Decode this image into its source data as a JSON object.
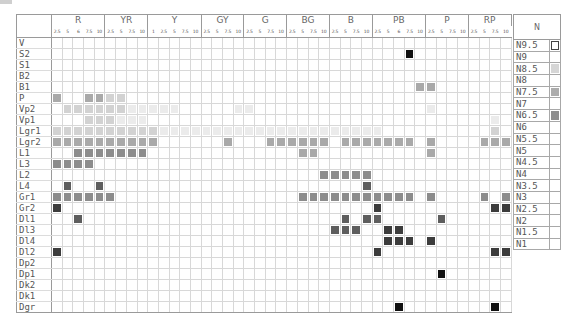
{
  "chart_data": {
    "type": "heatmap",
    "column_groups": [
      {
        "hue": "R",
        "steps": [
          "2.5",
          "5",
          "6",
          "7.5",
          "10"
        ]
      },
      {
        "hue": "YR",
        "steps": [
          "2.5",
          "5",
          "7.5",
          "10"
        ]
      },
      {
        "hue": "Y",
        "steps": [
          "1",
          "2.5",
          "5",
          "7.5",
          "10"
        ]
      },
      {
        "hue": "GY",
        "steps": [
          "2.5",
          "5",
          "7.5",
          "10"
        ]
      },
      {
        "hue": "G",
        "steps": [
          "2.5",
          "5",
          "7.5",
          "10"
        ]
      },
      {
        "hue": "BG",
        "steps": [
          "2.5",
          "5",
          "7.5",
          "10"
        ]
      },
      {
        "hue": "B",
        "steps": [
          "2.5",
          "5",
          "7.5",
          "10"
        ]
      },
      {
        "hue": "PB",
        "steps": [
          "2.5",
          "5",
          "6",
          "7.5",
          "10"
        ]
      },
      {
        "hue": "P",
        "steps": [
          "2.5",
          "5",
          "7.5",
          "10"
        ]
      },
      {
        "hue": "RP",
        "steps": [
          "2.5",
          "5",
          "7.5",
          "10"
        ]
      }
    ],
    "row_groups": [
      [
        "V"
      ],
      [
        "S2",
        "S1"
      ],
      [
        "B2",
        "B1"
      ],
      [
        "P"
      ],
      [
        "Vp2",
        "Vp1"
      ],
      [
        "Lgr1",
        "Lgr2"
      ],
      [
        "L1",
        "L3",
        "L2",
        "L4"
      ],
      [
        "Gr1",
        "Gr2"
      ],
      [
        "Dl1",
        "Dl3",
        "Dl4",
        "Dl2"
      ],
      [
        "Dp2",
        "Dp1"
      ],
      [
        "Dk2",
        "Dk1"
      ],
      [
        "Dgr"
      ]
    ],
    "shade_scale": {
      "L": "#ebebeb",
      "ML": "#d2d2d2",
      "M": "#a9a9a9",
      "MD": "#8c8c8c",
      "D": "#5e5e5e",
      "DK": "#3c3c3c",
      "K": "#111111"
    },
    "rows": [
      {
        "label": "V",
        "cells": {}
      },
      {
        "label": "S2",
        "cells": {
          "33": "K"
        }
      },
      {
        "label": "S1",
        "cells": {}
      },
      {
        "label": "B2",
        "cells": {}
      },
      {
        "label": "B1",
        "cells": {
          "34": "M",
          "35": "M"
        }
      },
      {
        "label": "P",
        "cells": {
          "0": "M",
          "3": "M",
          "4": "M",
          "5": "ML",
          "6": "ML"
        }
      },
      {
        "label": "Vp2",
        "cells": {
          "1": "ML",
          "2": "ML",
          "3": "ML",
          "4": "ML",
          "5": "ML",
          "6": "ML",
          "7": "L",
          "8": "L",
          "9": "L",
          "10": "L",
          "11": "L",
          "17": "L",
          "18": "L",
          "35": "L"
        }
      },
      {
        "label": "Vp1",
        "cells": {
          "3": "ML",
          "4": "ML",
          "5": "ML",
          "6": "L",
          "7": "L",
          "8": "L",
          "41": "L"
        }
      },
      {
        "label": "Lgr1",
        "cells": {
          "0": "ML",
          "1": "ML",
          "2": "ML",
          "3": "ML",
          "4": "ML",
          "5": "ML",
          "6": "ML",
          "7": "ML",
          "8": "ML",
          "9": "ML",
          "10": "L",
          "11": "L",
          "12": "L",
          "13": "L",
          "14": "L",
          "15": "L",
          "16": "L",
          "17": "L",
          "18": "L",
          "19": "L",
          "20": "L",
          "21": "L",
          "22": "L",
          "23": "L",
          "24": "L",
          "25": "L",
          "26": "L",
          "27": "L",
          "28": "L",
          "29": "L",
          "30": "L",
          "41": "ML"
        }
      },
      {
        "label": "Lgr2",
        "cells": {
          "0": "M",
          "1": "M",
          "2": "M",
          "3": "M",
          "4": "M",
          "5": "M",
          "6": "M",
          "7": "M",
          "8": "M",
          "9": "M",
          "16": "M",
          "20": "M",
          "21": "M",
          "22": "M",
          "23": "M",
          "24": "M",
          "25": "M",
          "27": "M",
          "28": "M",
          "29": "M",
          "30": "M",
          "31": "M",
          "32": "M",
          "33": "M",
          "35": "M",
          "40": "M",
          "41": "M",
          "42": "M"
        }
      },
      {
        "label": "L1",
        "cells": {
          "2": "MD",
          "3": "MD",
          "4": "MD",
          "5": "MD",
          "6": "MD",
          "7": "MD",
          "8": "MD",
          "23": "M",
          "24": "M",
          "35": "M"
        }
      },
      {
        "label": "L3",
        "cells": {
          "0": "MD",
          "1": "MD",
          "2": "MD",
          "3": "MD"
        }
      },
      {
        "label": "L2",
        "cells": {
          "25": "MD",
          "26": "MD",
          "27": "MD",
          "28": "MD",
          "29": "MD"
        }
      },
      {
        "label": "L4",
        "cells": {
          "1": "D",
          "4": "D",
          "29": "D"
        }
      },
      {
        "label": "Gr1",
        "cells": {
          "0": "MD",
          "1": "MD",
          "2": "MD",
          "3": "MD",
          "4": "MD",
          "5": "MD",
          "23": "MD",
          "24": "MD",
          "25": "MD",
          "26": "MD",
          "27": "MD",
          "28": "MD",
          "29": "MD",
          "30": "MD",
          "31": "MD",
          "32": "MD",
          "33": "MD",
          "35": "MD",
          "40": "MD",
          "42": "MD"
        }
      },
      {
        "label": "Gr2",
        "cells": {
          "0": "DK",
          "30": "DK",
          "41": "DK",
          "42": "DK"
        }
      },
      {
        "label": "Dl1",
        "cells": {
          "2": "D",
          "27": "D",
          "29": "D",
          "30": "D",
          "36": "D"
        }
      },
      {
        "label": "Dl3",
        "cells": {
          "26": "D",
          "27": "D",
          "28": "D",
          "31": "DK",
          "32": "DK"
        }
      },
      {
        "label": "Dl4",
        "cells": {
          "31": "DK",
          "32": "DK",
          "33": "DK",
          "35": "DK"
        }
      },
      {
        "label": "Dl2",
        "cells": {
          "0": "DK",
          "30": "DK",
          "41": "DK",
          "42": "DK"
        }
      },
      {
        "label": "Dp2",
        "cells": {}
      },
      {
        "label": "Dp1",
        "cells": {
          "36": "K"
        }
      },
      {
        "label": "Dk2",
        "cells": {}
      },
      {
        "label": "Dk1",
        "cells": {}
      },
      {
        "label": "Dgr",
        "cells": {
          "32": "K",
          "41": "K"
        }
      }
    ],
    "neutral": {
      "header": "N",
      "rows": [
        {
          "label": "N9.5",
          "swatch": "#ffffff",
          "outlined": true
        },
        {
          "label": "N9",
          "swatch": null
        },
        {
          "label": "N8.5",
          "swatch": "#d6d6d6"
        },
        {
          "label": "N8",
          "swatch": null
        },
        {
          "label": "N7.5",
          "swatch": "#acacac"
        },
        {
          "label": "N7",
          "swatch": null
        },
        {
          "label": "N6.5",
          "swatch": "#8e8e8e"
        },
        {
          "label": "N6",
          "swatch": null
        },
        {
          "label": "N5.5",
          "swatch": null
        },
        {
          "label": "N5",
          "swatch": null
        },
        {
          "label": "N4.5",
          "swatch": null
        },
        {
          "label": "N4",
          "swatch": null
        },
        {
          "label": "N3.5",
          "swatch": null
        },
        {
          "label": "N3",
          "swatch": null
        },
        {
          "label": "N2.5",
          "swatch": null
        },
        {
          "label": "N2",
          "swatch": null
        },
        {
          "label": "N1.5",
          "swatch": null
        },
        {
          "label": "N1",
          "swatch": null
        }
      ]
    }
  }
}
